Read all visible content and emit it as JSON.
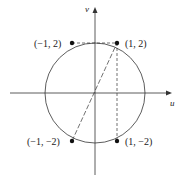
{
  "diagram": {
    "axes": {
      "horizontal_label": "u",
      "vertical_label": "v"
    },
    "circle": {
      "center": [
        0,
        0
      ],
      "radius_description": "passes through (±1, ±2)"
    },
    "points": [
      {
        "label": "(−1, 2)",
        "x": -1,
        "y": 2
      },
      {
        "label": "(1, 2)",
        "x": 1,
        "y": 2
      },
      {
        "label": "(−1, −2)",
        "x": -1,
        "y": -2
      },
      {
        "label": "(1, −2)",
        "x": 1,
        "y": -2
      }
    ]
  }
}
